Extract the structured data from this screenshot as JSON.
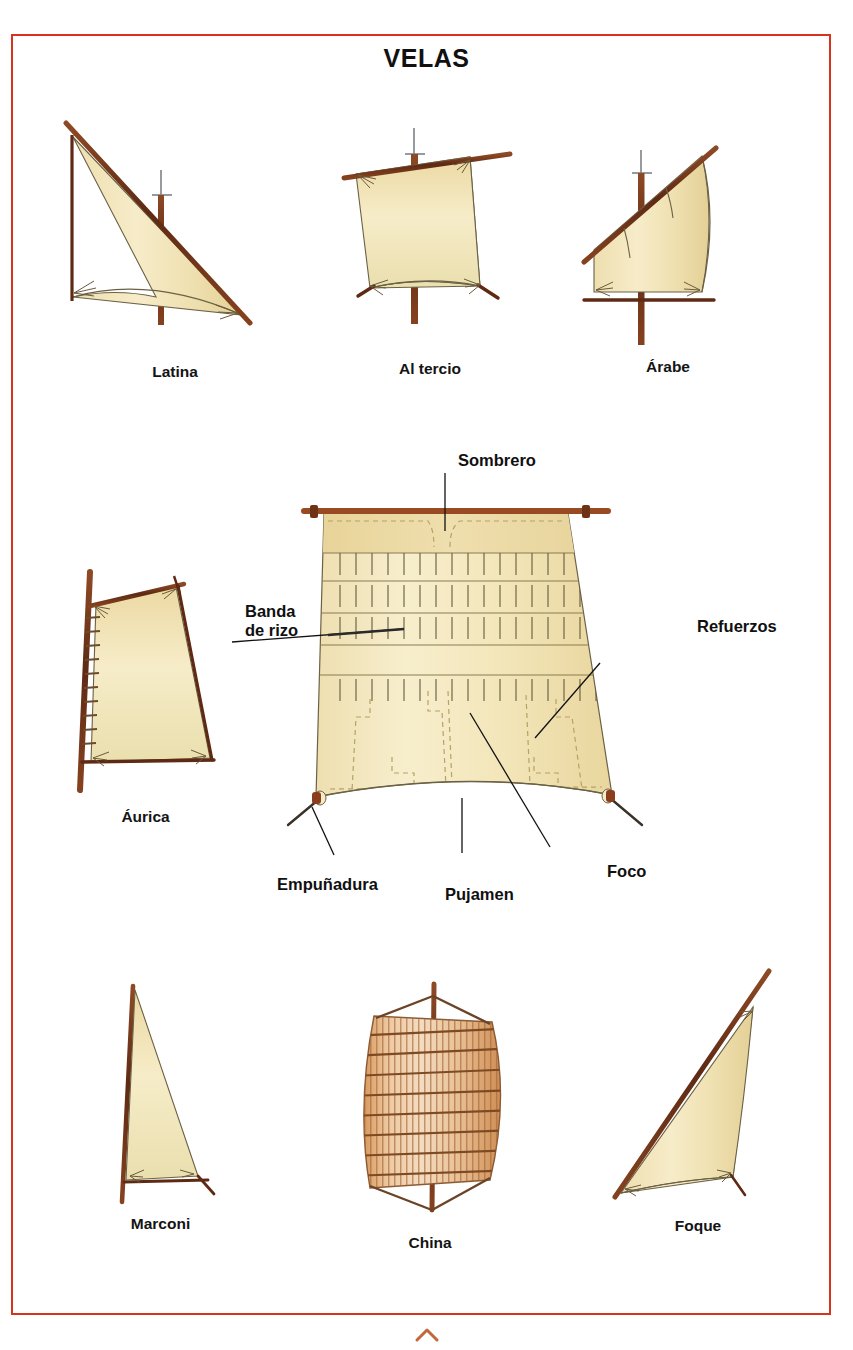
{
  "plate": {
    "title": "VELAS",
    "frame_color": "#d6341c",
    "background": "#ffffff",
    "sail_fill": "#f3e3b4",
    "sail_fill_dark": "#e6cf93",
    "spar_color": "#7d3b1e",
    "outline_color": "#6b6146",
    "label_color": "#101010",
    "junk_panel_color": "#d99a62"
  },
  "figures": [
    {
      "id": "latina",
      "caption": "Latina"
    },
    {
      "id": "al-tercio",
      "caption": "Al tercio"
    },
    {
      "id": "arabe",
      "caption": "Árabe"
    },
    {
      "id": "aurica",
      "caption": "Áurica"
    },
    {
      "id": "marconi",
      "caption": "Marconi"
    },
    {
      "id": "china",
      "caption": "China"
    },
    {
      "id": "foque",
      "caption": "Foque"
    }
  ],
  "main_diagram": {
    "labels": [
      {
        "id": "sombrero",
        "text": "Sombrero"
      },
      {
        "id": "banda-de-rizo",
        "text_line1": "Banda",
        "text_line2": "de rizo"
      },
      {
        "id": "refuerzos",
        "text": "Refuerzos"
      },
      {
        "id": "empunadura",
        "text": "Empuñadura"
      },
      {
        "id": "pujamen",
        "text": "Pujamen"
      },
      {
        "id": "foco",
        "text": "Foco"
      }
    ],
    "reef_bands": 4,
    "reef_points_per_band": 17
  }
}
